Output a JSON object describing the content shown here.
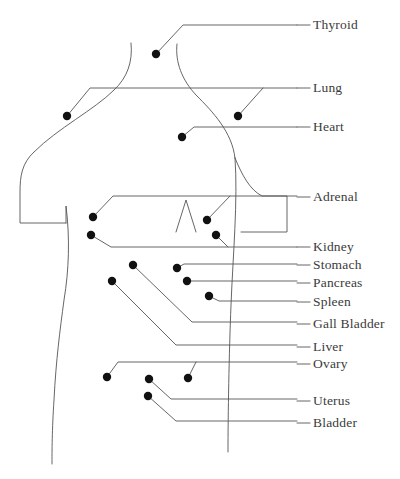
{
  "figure": {
    "type": "anatomical-organ-location-diagram",
    "background_color": "#ffffff",
    "line_color": "#555555",
    "outline_color": "#555555",
    "dot_color": "#111111",
    "text_color": "#3b3b3b",
    "dot_radius": 4.2,
    "label_dash": "—"
  },
  "labels": [
    {
      "id": "thyroid",
      "text": "Thyroid",
      "x": 313,
      "y": 25,
      "dash_x1": 297,
      "dash_x2": 310
    },
    {
      "id": "lung",
      "text": "Lung",
      "x": 313,
      "y": 88,
      "dash_x1": 297,
      "dash_x2": 310
    },
    {
      "id": "heart",
      "text": "Heart",
      "x": 313,
      "y": 127,
      "dash_x1": 297,
      "dash_x2": 310
    },
    {
      "id": "adrenal",
      "text": "Adrenal",
      "x": 313,
      "y": 197,
      "dash_x1": 297,
      "dash_x2": 310
    },
    {
      "id": "kidney",
      "text": "Kidney",
      "x": 313,
      "y": 247,
      "dash_x1": 297,
      "dash_x2": 310
    },
    {
      "id": "stomach",
      "text": "Stomach",
      "x": 313,
      "y": 265,
      "dash_x1": 297,
      "dash_x2": 310
    },
    {
      "id": "pancreas",
      "text": "Pancreas",
      "x": 313,
      "y": 283,
      "dash_x1": 297,
      "dash_x2": 310
    },
    {
      "id": "spleen",
      "text": "Spleen",
      "x": 313,
      "y": 302,
      "dash_x1": 297,
      "dash_x2": 310
    },
    {
      "id": "gall-bladder",
      "text": "Gall Bladder",
      "x": 313,
      "y": 324,
      "dash_x1": 297,
      "dash_x2": 310
    },
    {
      "id": "liver",
      "text": "Liver",
      "x": 313,
      "y": 347,
      "dash_x1": 297,
      "dash_x2": 310
    },
    {
      "id": "ovary",
      "text": "Ovary",
      "x": 313,
      "y": 364,
      "dash_x1": 297,
      "dash_x2": 310
    },
    {
      "id": "uterus",
      "text": "Uterus",
      "x": 313,
      "y": 401,
      "dash_x1": 297,
      "dash_x2": 310
    },
    {
      "id": "bladder",
      "text": "Bladder",
      "x": 313,
      "y": 423,
      "dash_x1": 297,
      "dash_x2": 310
    }
  ],
  "markers": [
    {
      "id": "thyroid-dot",
      "organ": "Thyroid",
      "x": 156,
      "y": 54
    },
    {
      "id": "lung-left-dot",
      "organ": "Lung",
      "x": 67,
      "y": 116
    },
    {
      "id": "lung-right-dot",
      "organ": "Lung",
      "x": 238,
      "y": 116
    },
    {
      "id": "heart-dot",
      "organ": "Heart",
      "x": 182,
      "y": 137
    },
    {
      "id": "adrenal-left-dot",
      "organ": "Adrenal",
      "x": 93,
      "y": 217
    },
    {
      "id": "adrenal-right-dot",
      "organ": "Adrenal",
      "x": 207,
      "y": 220
    },
    {
      "id": "kidney-left-dot",
      "organ": "Kidney",
      "x": 91,
      "y": 235
    },
    {
      "id": "kidney-right-dot",
      "organ": "Kidney",
      "x": 216,
      "y": 235
    },
    {
      "id": "stomach-dot",
      "organ": "Stomach",
      "x": 177,
      "y": 268
    },
    {
      "id": "pancreas-dot",
      "organ": "Pancreas",
      "x": 187,
      "y": 281
    },
    {
      "id": "spleen-dot",
      "organ": "Spleen",
      "x": 209,
      "y": 296
    },
    {
      "id": "gall-bladder-dot",
      "organ": "Gall Bladder",
      "x": 133,
      "y": 265
    },
    {
      "id": "liver-dot",
      "organ": "Liver",
      "x": 112,
      "y": 281
    },
    {
      "id": "ovary-left-dot",
      "organ": "Ovary",
      "x": 107,
      "y": 377
    },
    {
      "id": "ovary-right-dot",
      "organ": "Ovary",
      "x": 188,
      "y": 378
    },
    {
      "id": "uterus-dot",
      "organ": "Uterus",
      "x": 149,
      "y": 379
    },
    {
      "id": "bladder-dot",
      "organ": "Bladder",
      "x": 148,
      "y": 396
    }
  ],
  "leaders": [
    {
      "id": "thyroid-leader",
      "organ": "Thyroid",
      "path": "M156,54 L183,25 L297,25"
    },
    {
      "id": "lung-left-leader",
      "organ": "Lung",
      "path": "M67,116 L90,88 L297,88"
    },
    {
      "id": "lung-right-leader",
      "organ": "Lung",
      "path": "M238,116 L263,88"
    },
    {
      "id": "heart-leader",
      "organ": "Heart",
      "path": "M182,137 L194,127 L297,127"
    },
    {
      "id": "adrenal-left-leader",
      "organ": "Adrenal",
      "path": "M93,217 L113,196 L297,196"
    },
    {
      "id": "adrenal-right-leader",
      "organ": "Adrenal",
      "path": "M207,220 L230,196"
    },
    {
      "id": "kidney-left-leader",
      "organ": "Kidney",
      "path": "M91,235 L111,247 L297,247"
    },
    {
      "id": "kidney-right-leader",
      "organ": "Kidney",
      "path": "M216,235 L228,247"
    },
    {
      "id": "stomach-leader",
      "organ": "Stomach",
      "path": "M177,268 L184,264 L297,264"
    },
    {
      "id": "pancreas-leader",
      "organ": "Pancreas",
      "path": "M187,281 L192,281 L297,281"
    },
    {
      "id": "spleen-leader",
      "organ": "Spleen",
      "path": "M209,296 L219,301 L297,301"
    },
    {
      "id": "gall-bladder-leader",
      "organ": "Gall Bladder",
      "path": "M133,265 L192,322 L297,322"
    },
    {
      "id": "liver-leader",
      "organ": "Liver",
      "path": "M112,281 L176,345 L297,345"
    },
    {
      "id": "ovary-left-leader",
      "organ": "Ovary",
      "path": "M107,377 L118,362 L297,362"
    },
    {
      "id": "ovary-right-leader",
      "organ": "Ovary",
      "path": "M188,378 L196,362"
    },
    {
      "id": "uterus-leader",
      "organ": "Uterus",
      "path": "M149,379 L171,399 L297,399"
    },
    {
      "id": "bladder-leader",
      "organ": "Bladder",
      "path": "M148,396 L176,421 L297,421"
    }
  ],
  "body_outline": {
    "neck_left": "M130,44 C133,60 128,76 116,88 C96,108 60,126 35,150",
    "neck_right": "M178,44 C176,62 182,80 196,94 C214,112 234,134 236,160 C238,200 234,260 232,310 C230,360 228,420 228,452",
    "left_side": "M35,150 C22,162 20,176 20,192 L20,223 L66,223 L66,206",
    "left_torso": "M66,206 C70,240 68,300 63,340 C58,390 53,440 52,464",
    "right_arm": "M236,160 C243,176 250,190 262,196 L287,196 L287,232 L240,232",
    "shoulders_left": "M130,44 C118,52 104,62 88,74",
    "shoulders_right": "M178,44 C188,52 198,60 210,72"
  }
}
